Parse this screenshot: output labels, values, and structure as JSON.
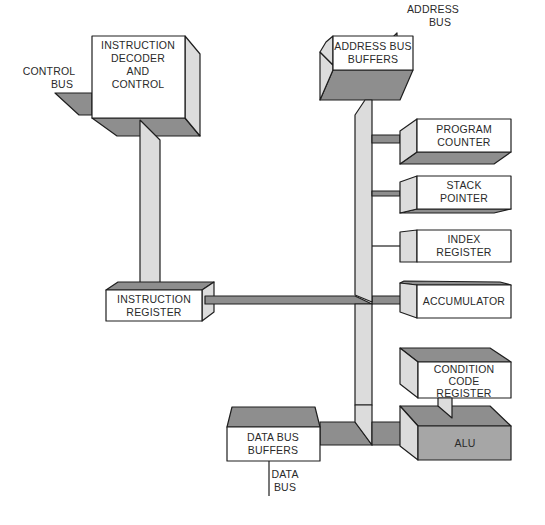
{
  "diagram": {
    "type": "microprocessor block diagram",
    "colors": {
      "front_face": "#ffffff",
      "light_face": "#dcdcdc",
      "dark_face": "#8e8e8e",
      "alu_face": "#a6a6a6",
      "outline": "#1e1e1e"
    },
    "blocks": {
      "instruction_decoder": {
        "line1": "INSTRUCTION",
        "line2": "DECODER",
        "line3": "AND",
        "line4": "CONTROL"
      },
      "instruction_register": {
        "line1": "INSTRUCTION",
        "line2": "REGISTER"
      },
      "address_bus_buffers": {
        "line1": "ADDRESS BUS",
        "line2": "BUFFERS"
      },
      "program_counter": {
        "line1": "PROGRAM",
        "line2": "COUNTER"
      },
      "stack_pointer": {
        "line1": "STACK",
        "line2": "POINTER"
      },
      "index_register": {
        "line1": "INDEX",
        "line2": "REGISTER"
      },
      "accumulator": {
        "line1": "ACCUMULATOR"
      },
      "condition_code_register": {
        "line1": "CONDITION",
        "line2": "CODE",
        "line3": "REGISTER"
      },
      "alu": {
        "line1": "ALU"
      },
      "data_bus_buffers": {
        "line1": "DATA BUS",
        "line2": "BUFFERS"
      }
    },
    "external_labels": {
      "control_bus": {
        "line1": "CONTROL",
        "line2": "BUS"
      },
      "address_bus": {
        "line1": "ADDRESS",
        "line2": "BUS"
      },
      "data_bus": {
        "line1": "DATA",
        "line2": "BUS"
      }
    },
    "connections": [
      {
        "from": "control_bus",
        "to": "instruction_decoder"
      },
      {
        "from": "instruction_decoder",
        "to": "instruction_register"
      },
      {
        "from": "instruction_register",
        "to": "accumulator"
      },
      {
        "from": "address_bus_buffers",
        "to": "address_bus"
      },
      {
        "from": "address_bus_buffers",
        "to": "program_counter"
      },
      {
        "from": "address_bus_buffers",
        "to": "stack_pointer"
      },
      {
        "from": "address_bus_buffers",
        "to": "index_register"
      },
      {
        "from": "address_bus_buffers",
        "to": "accumulator"
      },
      {
        "from": "data_bus_buffers",
        "to": "alu"
      },
      {
        "from": "condition_code_register",
        "to": "alu"
      },
      {
        "from": "data_bus_buffers",
        "to": "data_bus"
      }
    ]
  }
}
